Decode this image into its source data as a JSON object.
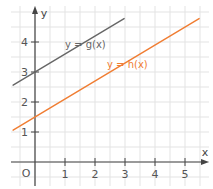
{
  "chart_data": {
    "type": "line",
    "title": "",
    "xlabel": "x",
    "ylabel": "y",
    "origin_label": "O",
    "xlim": [
      -0.8,
      5.8
    ],
    "ylim": [
      -0.8,
      5.2
    ],
    "grid": true,
    "grid_step": 0.5,
    "x_ticks": [
      "1",
      "2",
      "3",
      "4",
      "5"
    ],
    "y_ticks": [
      "1",
      "2",
      "3",
      "4"
    ],
    "series": [
      {
        "name": "y = g(x)",
        "label": "y = g(x)",
        "slope": 0.6,
        "intercept": 3,
        "x": [
          -0.73,
          2.97
        ],
        "y": [
          2.56,
          4.78
        ],
        "color": "#666666"
      },
      {
        "name": "y = h(x)",
        "label": "y = h(x)",
        "slope": 0.6,
        "intercept": 1.5,
        "x": [
          -0.73,
          5.47
        ],
        "y": [
          1.06,
          4.78
        ],
        "color": "#f07d32"
      }
    ]
  },
  "colors": {
    "grid": "#e3e3e3",
    "axis": "#444444",
    "g_line": "#666666",
    "h_line": "#f07d32"
  }
}
